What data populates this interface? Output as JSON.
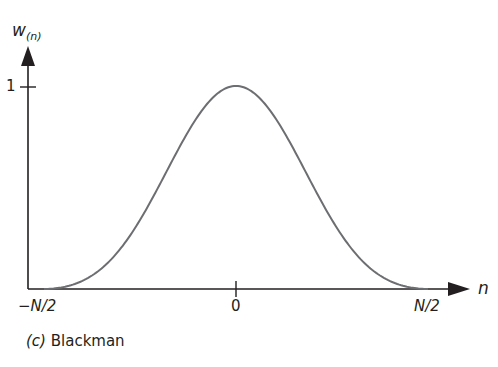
{
  "chart_data": {
    "type": "line",
    "title": "(c) Blackman",
    "caption_prefix": "(c)",
    "caption_name": "Blackman",
    "xlabel": "n",
    "ylabel": "w(n)",
    "ylabel_main": "w",
    "ylabel_sub": "(n)",
    "x_ticks": [
      "−N/2",
      "0",
      "N/2"
    ],
    "y_ticks": [
      "1"
    ],
    "xlim": [
      -0.5,
      0.5
    ],
    "ylim": [
      0,
      1
    ],
    "grid": false,
    "legend": null,
    "series": [
      {
        "name": "Blackman window",
        "color": "#6d6e71",
        "x": [
          -0.5,
          -0.4,
          -0.3,
          -0.2,
          -0.1,
          0,
          0.1,
          0.2,
          0.3,
          0.4,
          0.5
        ],
        "values": [
          0.0,
          0.04,
          0.2,
          0.51,
          0.85,
          1.0,
          0.85,
          0.51,
          0.2,
          0.04,
          0.0
        ]
      }
    ]
  },
  "labels": {
    "y_axis_main": "w",
    "y_axis_sub": "(n)",
    "x_axis": "n",
    "tick_neg": "−N/2",
    "tick_zero": "0",
    "tick_pos": "N/2",
    "tick_one": "1",
    "caption_prefix": "(c)",
    "caption_name": "Blackman"
  }
}
